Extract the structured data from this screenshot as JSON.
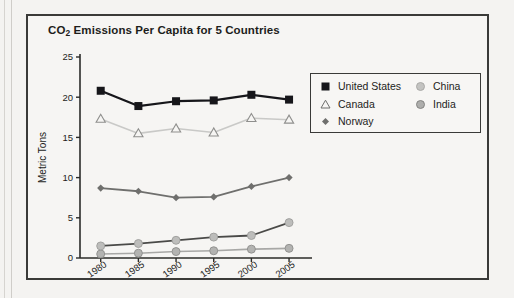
{
  "chart_box": {
    "title_prefix": "CO",
    "title_sub": "2",
    "title_suffix": " Emissions Per Capita for 5 Countries"
  },
  "legend": {
    "items": [
      {
        "label": "United States",
        "marker": "filled-square-marker",
        "color": "#16161a"
      },
      {
        "label": "Canada",
        "marker": "open-triangle-marker",
        "color": "#c9c9c7"
      },
      {
        "label": "Norway",
        "marker": "filled-diamond-marker",
        "color": "#6f6f6d"
      },
      {
        "label": "China",
        "marker": "light-circle-marker",
        "color": "#bdbdbb"
      },
      {
        "label": "India",
        "marker": "gray-circle-marker",
        "color": "#9a9a98"
      }
    ]
  },
  "chart_data": {
    "type": "line",
    "title": "CO2 Emissions Per Capita for 5 Countries",
    "xlabel": "",
    "ylabel": "Metric Tons",
    "categories": [
      "1980",
      "1985",
      "1990",
      "1995",
      "2000",
      "2005"
    ],
    "x_tick_rotation": -35,
    "ylim": [
      0,
      25
    ],
    "yticks": [
      0,
      5,
      10,
      15,
      20,
      25
    ],
    "grid": false,
    "legend_position": "upper-right-inset",
    "series": [
      {
        "name": "United States",
        "values": [
          20.8,
          18.9,
          19.5,
          19.6,
          20.3,
          19.7
        ],
        "color": "#16161a",
        "marker": "filled-square",
        "line_width": 2.2
      },
      {
        "name": "Canada",
        "values": [
          17.3,
          15.5,
          16.1,
          15.6,
          17.4,
          17.2
        ],
        "color": "#c9c9c7",
        "marker": "open-triangle",
        "line_width": 1.6
      },
      {
        "name": "Norway",
        "values": [
          8.7,
          8.3,
          7.5,
          7.6,
          8.9,
          10.0
        ],
        "color": "#6f6f6d",
        "marker": "filled-diamond",
        "line_width": 1.8
      },
      {
        "name": "China",
        "values": [
          1.5,
          1.8,
          2.2,
          2.6,
          2.8,
          4.4
        ],
        "color": "#4a4a48",
        "marker": "light-circle",
        "line_width": 1.8
      },
      {
        "name": "India",
        "values": [
          0.5,
          0.6,
          0.8,
          0.9,
          1.1,
          1.2
        ],
        "color": "#a8a8a6",
        "marker": "gray-circle",
        "line_width": 1.6
      }
    ]
  }
}
